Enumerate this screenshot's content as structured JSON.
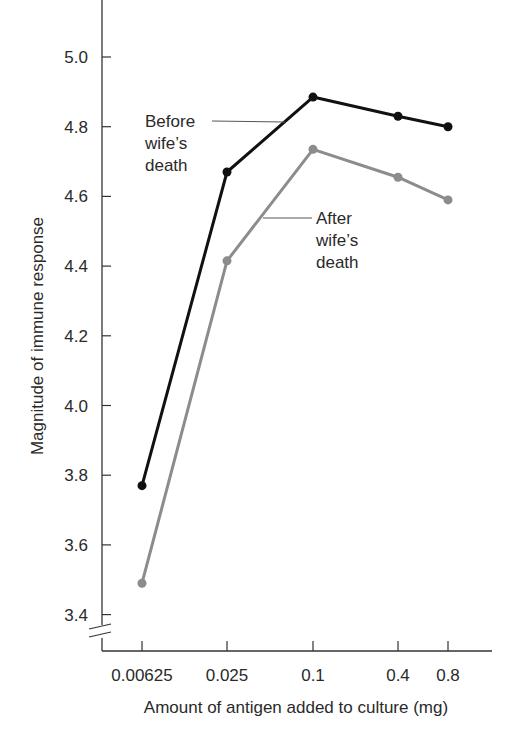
{
  "chart_data": {
    "type": "line",
    "title": "",
    "xlabel": "Amount of antigen added to culture (mg)",
    "ylabel": "Magnitude of immune response",
    "categories": [
      "0.00625",
      "0.025",
      "0.1",
      "0.4",
      "0.8"
    ],
    "x": [
      0.00625,
      0.025,
      0.1,
      0.4,
      0.8
    ],
    "ylim": [
      3.4,
      5.0
    ],
    "y_axis_break": true,
    "yticks": [
      "5.0",
      "4.8",
      "4.6",
      "4.4",
      "4.2",
      "4.0",
      "3.8",
      "3.6",
      "3.4"
    ],
    "grid": false,
    "legend": "inline annotations",
    "series": [
      {
        "name": "Before wife's death",
        "color": "#111111",
        "values": [
          3.77,
          4.67,
          4.885,
          4.83,
          4.8
        ],
        "annotation_lines": [
          "Before",
          "wife’s",
          "death"
        ]
      },
      {
        "name": "After wife's death",
        "color": "#8c8c8c",
        "values": [
          3.49,
          4.415,
          4.735,
          4.655,
          4.59
        ],
        "annotation_lines": [
          "After",
          "wife’s",
          "death"
        ]
      }
    ]
  }
}
